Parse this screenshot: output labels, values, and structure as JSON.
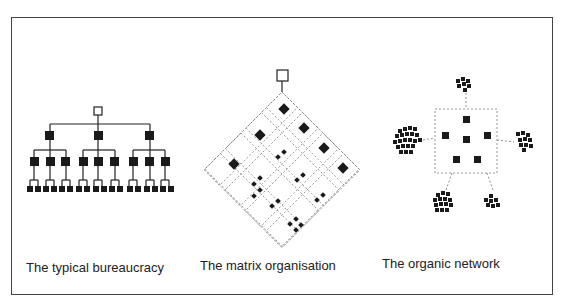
{
  "diagram": {
    "panels": [
      {
        "id": "bureaucracy",
        "label": "The typical bureaucracy"
      },
      {
        "id": "matrix",
        "label": "The matrix organisation"
      },
      {
        "id": "network",
        "label": "The organic network"
      }
    ],
    "colors": {
      "frame": "#444444",
      "node": "#1a1a1a",
      "dashed": "#888888"
    }
  }
}
